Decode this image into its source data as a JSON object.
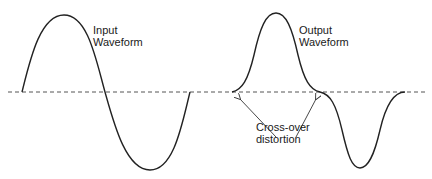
{
  "diagram": {
    "labels": {
      "input_line1": "Input",
      "input_line2": "Waveform",
      "output_line1": "Output",
      "output_line2": "Waveform",
      "distortion_line1": "Cross-over",
      "distortion_line2": "distortion"
    },
    "waveforms": [
      {
        "name": "Input Waveform",
        "shape": "sine",
        "cycles": 1
      },
      {
        "name": "Output Waveform",
        "shape": "sine with flattened zero-crossings",
        "cycles": 1
      }
    ],
    "annotation": {
      "text": "Cross-over distortion",
      "arrows": 2
    },
    "colors": {
      "line": "#222222",
      "axis": "#555555",
      "background": "#ffffff"
    }
  }
}
